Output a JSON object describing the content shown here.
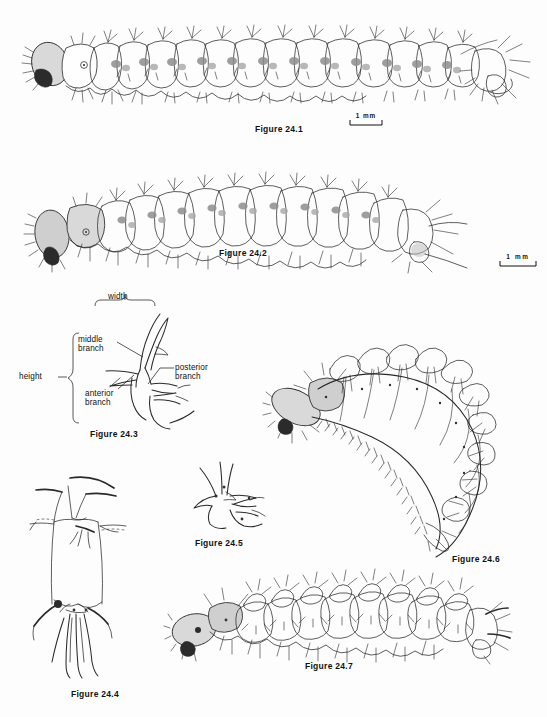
{
  "plate": {
    "title": "Plate 24 — Larval morphology figures",
    "background_color": "#fdfdfd",
    "ink_color": "#2a2a2a"
  },
  "figures": [
    {
      "id": "fig-24-1",
      "caption": "Figure 24.1",
      "subject": "lateral view of larva with branched setae",
      "caption_x": 255,
      "caption_y": 124
    },
    {
      "id": "fig-24-2",
      "caption": "Figure 24.2",
      "subject": "lateral view of larva, curved body, dorsal tubercles",
      "caption_x": 219,
      "caption_y": 248
    },
    {
      "id": "fig-24-3",
      "caption": "Figure 24.3",
      "subject": "branched seta showing measurement terminology",
      "caption_x": 90,
      "caption_y": 429
    },
    {
      "id": "fig-24-4",
      "caption": "Figure 24.4",
      "subject": "dorsal view of larval segment with long setae",
      "caption_x": 71,
      "caption_y": 689
    },
    {
      "id": "fig-24-5",
      "caption": "Figure 24.5",
      "subject": "branched seta, detail",
      "caption_x": 195,
      "caption_y": 538
    },
    {
      "id": "fig-24-6",
      "caption": "Figure 24.6",
      "subject": "strongly curved larva with spinose tubercles",
      "caption_x": 452,
      "caption_y": 554
    },
    {
      "id": "fig-24-7",
      "caption": "Figure 24.7",
      "subject": "lateral view of larva with spiny tubercles",
      "caption_x": 305,
      "caption_y": 661
    }
  ],
  "annotations": {
    "width": "width",
    "height": "height",
    "middle_branch_line1": "middle",
    "middle_branch_line2": "branch",
    "anterior_branch_line1": "anterior",
    "anterior_branch_line2": "branch",
    "posterior_branch_line1": "posterior",
    "posterior_branch_line2": "branch"
  },
  "scale_bars": [
    {
      "id": "scale-bar-1",
      "label": "1 mm",
      "x": 350,
      "y": 113,
      "length_px": 32,
      "for_figure": "Figure 24.1"
    },
    {
      "id": "scale-bar-2",
      "label": "1 mm",
      "x": 500,
      "y": 254,
      "length_px": 36,
      "for_figure": "Figure 24.2"
    }
  ]
}
